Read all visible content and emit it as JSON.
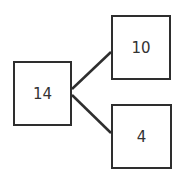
{
  "diagram": {
    "type": "tree",
    "root": {
      "label": "14"
    },
    "children": [
      {
        "label": "10"
      },
      {
        "label": "4"
      }
    ],
    "edges": [
      {
        "from": "14",
        "to": "10"
      },
      {
        "from": "14",
        "to": "4"
      }
    ],
    "colors": {
      "stroke": "#2e2e2e",
      "fill": "#ffffff",
      "text": "#333333"
    }
  }
}
